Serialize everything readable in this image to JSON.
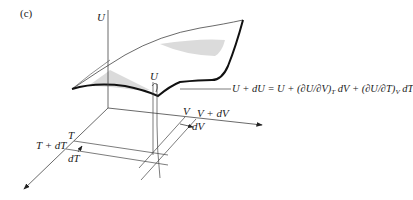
{
  "figure": {
    "panel_label": "(c)",
    "axes": {
      "u_axis_label": "U",
      "v_axis_label": "V",
      "t_axis_label": "T"
    },
    "surface_point_label": "U",
    "v_labels": {
      "v": "V",
      "v_plus_dv": "V + dV",
      "dv": "dV"
    },
    "t_labels": {
      "t": "T",
      "t_plus_dt": "T + dT",
      "dt": "dT"
    },
    "formula": {
      "lhs": "U + dU = U + ",
      "term1": "(∂U/∂V)",
      "term1_sub": "T",
      "term1_tail": " dV + ",
      "term2": "(∂U/∂T)",
      "term2_sub": "V",
      "term2_tail": " dT"
    },
    "colors": {
      "line": "#333333",
      "surface_edge": "#111111",
      "shading": "#c8c8c8"
    }
  }
}
